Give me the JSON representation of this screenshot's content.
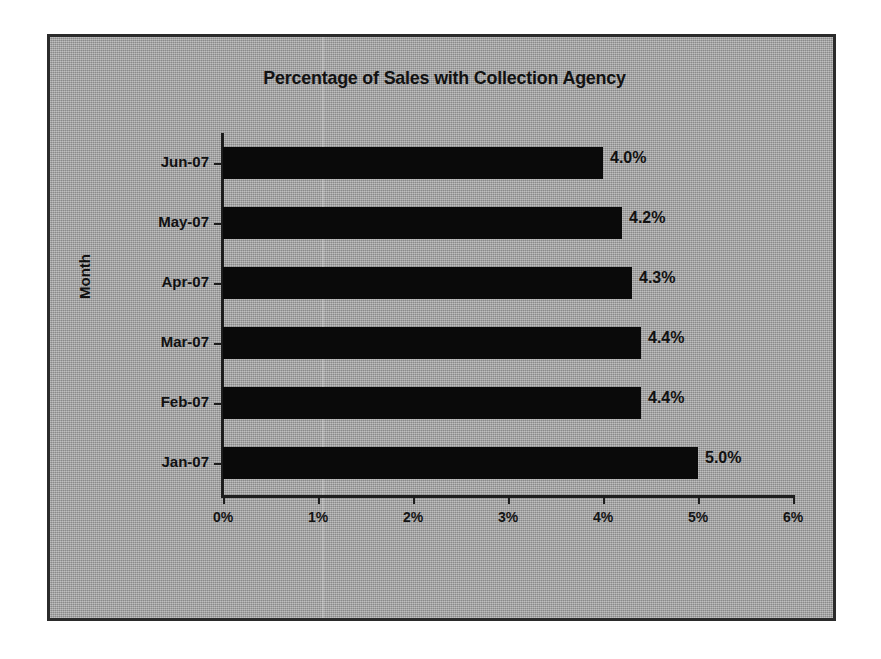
{
  "chart_data": {
    "type": "bar",
    "orientation": "horizontal",
    "title": "Percentage of Sales with Collection Agency",
    "xlabel": "",
    "ylabel": "Month",
    "categories": [
      "Jun-07",
      "May-07",
      "Apr-07",
      "Mar-07",
      "Feb-07",
      "Jan-07"
    ],
    "values": [
      4.0,
      4.2,
      4.3,
      4.4,
      4.4,
      5.0
    ],
    "data_labels": [
      "4.0%",
      "4.2%",
      "4.3%",
      "4.4%",
      "4.4%",
      "5.0%"
    ],
    "xlim": [
      0,
      6
    ],
    "x_tick_labels": [
      "0%",
      "1%",
      "2%",
      "3%",
      "4%",
      "5%",
      "6%"
    ],
    "x_tick_values": [
      0,
      1,
      2,
      3,
      4,
      5,
      6
    ],
    "grid": false,
    "legend": "none",
    "bar_color": "#0a0a0a",
    "plot_background_color": "#a8a8a8",
    "frame_border_color": "#2b2b2b",
    "text_color": "#111111"
  }
}
